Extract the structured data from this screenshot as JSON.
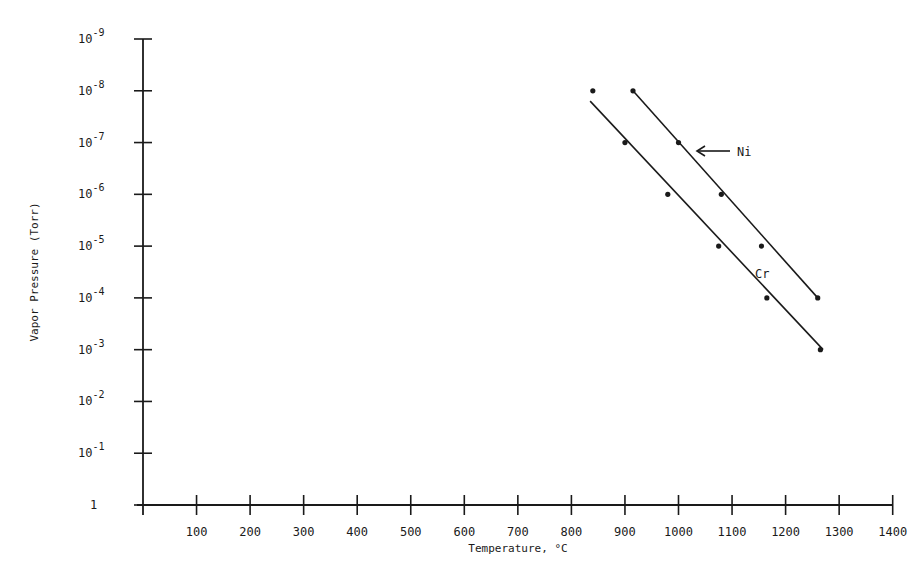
{
  "chart_data": {
    "type": "scatter",
    "title": "",
    "xlabel": "Temperature, °C",
    "ylabel": "Vapor Pressure (Torr)",
    "xlim": [
      0,
      1400
    ],
    "x_ticks": [
      100,
      200,
      300,
      400,
      500,
      600,
      700,
      800,
      900,
      1000,
      1100,
      1200,
      1300,
      1400
    ],
    "y_scale": "log",
    "y_axis_direction": "10^-9 at top, 1 at bottom",
    "y_ticks": [
      {
        "exp": -9,
        "label": "10",
        "sup": "-9"
      },
      {
        "exp": -8,
        "label": "10",
        "sup": "-8"
      },
      {
        "exp": -7,
        "label": "10",
        "sup": "-7"
      },
      {
        "exp": -6,
        "label": "10",
        "sup": "-6"
      },
      {
        "exp": -5,
        "label": "10",
        "sup": "-5"
      },
      {
        "exp": -4,
        "label": "10",
        "sup": "-4"
      },
      {
        "exp": -3,
        "label": "10",
        "sup": "-3"
      },
      {
        "exp": -2,
        "label": "10",
        "sup": "-2"
      },
      {
        "exp": -1,
        "label": "10",
        "sup": "-1"
      },
      {
        "exp": 0,
        "label": "1",
        "sup": ""
      }
    ],
    "grid": false,
    "legend": "inline labels",
    "series": [
      {
        "name": "Cr",
        "label": "Cr",
        "points": [
          {
            "x": 840,
            "exp": -8
          },
          {
            "x": 900,
            "exp": -7
          },
          {
            "x": 980,
            "exp": -6
          },
          {
            "x": 1075,
            "exp": -5
          },
          {
            "x": 1165,
            "exp": -4
          },
          {
            "x": 1265,
            "exp": -3
          }
        ],
        "fit_line": [
          {
            "x": 835,
            "exp": -7.8
          },
          {
            "x": 1270,
            "exp": -3
          }
        ]
      },
      {
        "name": "Ni",
        "label": "Ni",
        "points": [
          {
            "x": 915,
            "exp": -8
          },
          {
            "x": 1000,
            "exp": -7
          },
          {
            "x": 1080,
            "exp": -6
          },
          {
            "x": 1155,
            "exp": -5
          },
          {
            "x": 1260,
            "exp": -4
          }
        ],
        "fit_line": [
          {
            "x": 915,
            "exp": -8
          },
          {
            "x": 1260,
            "exp": -4
          }
        ]
      }
    ],
    "annotations": [
      {
        "text": "Ni",
        "arrow": true,
        "points_to_series": "Ni"
      },
      {
        "text": "Cr",
        "arrow": false,
        "points_to_series": "Cr"
      }
    ]
  },
  "labels": {
    "ylabel": "Vapor Pressure (Torr)",
    "xlabel": "Temperature, °C",
    "ni": "Ni",
    "cr": "Cr"
  },
  "colors": {
    "ink": "#1a1a1a",
    "background": "#ffffff"
  }
}
